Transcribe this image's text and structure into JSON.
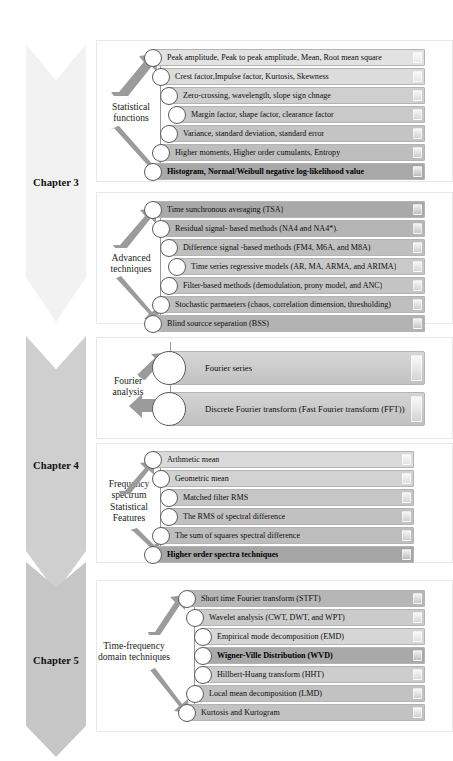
{
  "colors": {
    "chapter3_band": "#f2f2f2",
    "chapter4_band": "#cfcfcf",
    "chapter5_band": "#c6c6c6",
    "arrow": "#9b9b9b",
    "bar_border": "#b4b4b4",
    "circle_stroke": "#5a5a5a",
    "text": "#0d0d0d"
  },
  "chapters": [
    {
      "id": "chapter-3",
      "label": "Chapter 3",
      "band_color": "#f2f2f2",
      "groups": [
        {
          "id": "statistical-functions",
          "label": "Statistical\nfunctions",
          "rows": [
            {
              "text": "Peak amplitude, Peak to peak amplitude, Mean, Root mean square",
              "fill": "#e2e2e2",
              "indent": 0,
              "strong": false
            },
            {
              "text": "Crest factor,Impulse factor, Kurtosis, Skewness",
              "fill": "#dcdcdc",
              "indent": 8,
              "strong": false
            },
            {
              "text": "Zero-crossing, wavelength, slope sign chnage",
              "fill": "#cfcfcf",
              "indent": 16,
              "strong": false
            },
            {
              "text": "Margin factor, shape factor, clearance factor",
              "fill": "#c9c9c9",
              "indent": 24,
              "strong": false
            },
            {
              "text": "Variance, standard deviation, standard error",
              "fill": "#c4c4c4",
              "indent": 16,
              "strong": false
            },
            {
              "text": "Higher moments, Higher order cumulants, Entropy",
              "fill": "#bdbdbd",
              "indent": 8,
              "strong": false
            },
            {
              "text": "Histogram, Normal/Weibull negative log-likelihood value",
              "fill": "#a8a8a8",
              "indent": 0,
              "strong": true
            }
          ]
        },
        {
          "id": "advanced-techniques",
          "label": "Advanced\ntechniques",
          "rows": [
            {
              "text": "Time sunchronous averaging (TSA)",
              "fill": "#a9a9a9",
              "indent": 0,
              "strong": false
            },
            {
              "text": "Residual signal- based methods (NA4 and NA4*).",
              "fill": "#b5b5b5",
              "indent": 8,
              "strong": false
            },
            {
              "text": "Difference signal -based methods (FM4, M6A, and M8A)",
              "fill": "#bfbfbf",
              "indent": 16,
              "strong": false
            },
            {
              "text": "Time series regressive models (AR, MA, ARMA, and ARIMA)",
              "fill": "#c9c9c9",
              "indent": 24,
              "strong": false
            },
            {
              "text": "Filter-based methods (demodulation, prony model, and ANC)",
              "fill": "#c4c4c4",
              "indent": 16,
              "strong": false
            },
            {
              "text": "Stochastic parmaeters (chaos, correlation dimension, thresholding)",
              "fill": "#bfbfbf",
              "indent": 8,
              "strong": false
            },
            {
              "text": "Blind sourcce separation (BSS)",
              "fill": "#b3b3b3",
              "indent": 0,
              "strong": false
            }
          ]
        }
      ]
    },
    {
      "id": "chapter-4",
      "label": "Chapter 4",
      "band_color": "#cfcfcf",
      "groups": [
        {
          "id": "fourier-analysis",
          "label": "Fourier\nanalysis",
          "big": true,
          "rows": [
            {
              "text": "Fourier series",
              "fill": "#c8c8c8",
              "indent": 0,
              "strong": false
            },
            {
              "text": "Discrete Fourier transform (Fast Fourier transform (FFT))",
              "fill": "#c6c6c6",
              "indent": 0,
              "strong": false
            }
          ]
        },
        {
          "id": "frequency-spectrum-statistical-features",
          "label": "Frequency\nspectrum\nStatistical\nFeatures",
          "rows": [
            {
              "text": "Arthmetic mean",
              "fill": "#dadada",
              "indent": 0,
              "strong": false
            },
            {
              "text": "Geometric mean",
              "fill": "#d2d2d2",
              "indent": 8,
              "strong": false
            },
            {
              "text": "Matched filter RMS",
              "fill": "#c6c6c6",
              "indent": 16,
              "strong": false
            },
            {
              "text": "The RMS of spectral difference",
              "fill": "#c1c1c1",
              "indent": 16,
              "strong": false
            },
            {
              "text": "The sum of squares spectral difference",
              "fill": "#bdbdbd",
              "indent": 8,
              "strong": false
            },
            {
              "text": "Higher order spectra techniques",
              "fill": "#a5a5a5",
              "indent": 0,
              "strong": true
            }
          ]
        }
      ]
    },
    {
      "id": "chapter-5",
      "label": "Chapter 5",
      "band_color": "#c6c6c6",
      "groups": [
        {
          "id": "time-frequency-domain-techniques",
          "label": "Time-frequency\ndomain techniques",
          "rows": [
            {
              "text": "Short time Fourier transform (STFT)",
              "fill": "#b6b6b6",
              "indent": 0,
              "strong": false
            },
            {
              "text": "Wavelet analysis (CWT, DWT, and WPT)",
              "fill": "#cbcbcb",
              "indent": 8,
              "strong": false
            },
            {
              "text": "Empirical mode decomposition (EMD)",
              "fill": "#d6d6d6",
              "indent": 16,
              "strong": false
            },
            {
              "text": "Wigner-Ville Distribution (WVD)",
              "fill": "#a9a9a9",
              "indent": 16,
              "strong": true
            },
            {
              "text": "Hillbert-Huang transform (HHT)",
              "fill": "#cdcdcd",
              "indent": 16,
              "strong": false
            },
            {
              "text": "Local mean decomposition (LMD)",
              "fill": "#c2c2c2",
              "indent": 8,
              "strong": false
            },
            {
              "text": "Kurtosis and Kurtogram",
              "fill": "#c2c2c2",
              "indent": 0,
              "strong": false
            }
          ]
        }
      ]
    }
  ]
}
